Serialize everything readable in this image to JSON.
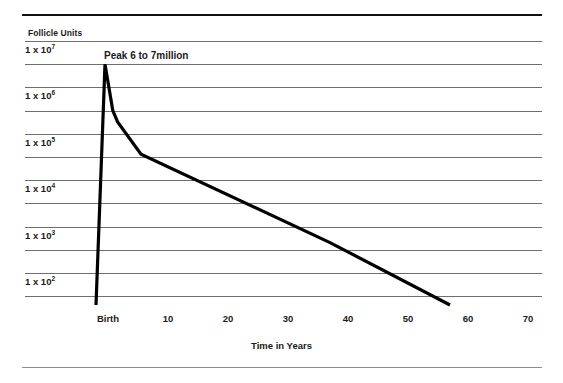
{
  "chart_data": {
    "type": "line",
    "title": "",
    "subtitle": "",
    "xlabel": "Time in Years",
    "ylabel": "Follicle Units",
    "xlim": [
      -8,
      70
    ],
    "ylim_log10": [
      1,
      7.6
    ],
    "grid": true,
    "grid_orientation": "horizontal",
    "legend": null,
    "legend_position": "none",
    "x_ticks": [
      {
        "label": "Birth",
        "value": 0
      },
      {
        "label": "10",
        "value": 10
      },
      {
        "label": "20",
        "value": 20
      },
      {
        "label": "30",
        "value": 30
      },
      {
        "label": "40",
        "value": 40
      },
      {
        "label": "50",
        "value": 50
      },
      {
        "label": "60",
        "value": 60
      },
      {
        "label": "70",
        "value": 70
      }
    ],
    "y_ticks": [
      {
        "mantissa": "1 x 10",
        "exponent": "7",
        "value": 10000000
      },
      {
        "mantissa": "1 x 10",
        "exponent": "6",
        "value": 1000000
      },
      {
        "mantissa": "1 x 10",
        "exponent": "5",
        "value": 100000
      },
      {
        "mantissa": "1 x 10",
        "exponent": "4",
        "value": 10000
      },
      {
        "mantissa": "1 x 10",
        "exponent": "3",
        "value": 1000
      },
      {
        "mantissa": "1 x 10",
        "exponent": "2",
        "value": 100
      }
    ],
    "annotations": [
      {
        "text": "Peak 6 to 7million",
        "x": 0,
        "y": 7000000
      }
    ],
    "series": [
      {
        "name": "Follicle Units",
        "color": "#000000",
        "points": [
          {
            "x": -2.0,
            "y": 10
          },
          {
            "x": -0.5,
            "y": 7000000
          },
          {
            "x": 0.8,
            "y": 700000
          },
          {
            "x": 1.6,
            "y": 400000
          },
          {
            "x": 5.5,
            "y": 80000
          },
          {
            "x": 37.0,
            "y": 1000
          },
          {
            "x": 57.0,
            "y": 10
          }
        ]
      }
    ]
  },
  "axis": {
    "y_title": "Follicle Units",
    "x_title": "Time in Years"
  }
}
